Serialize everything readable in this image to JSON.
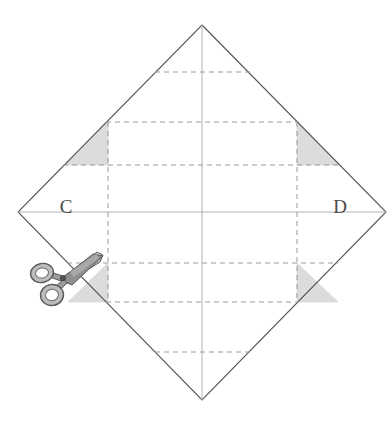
{
  "figure": {
    "canvas": {
      "width": 389,
      "height": 427,
      "background": "#ffffff"
    },
    "labels": [
      {
        "name": "vertex-label-c",
        "text": "C",
        "x": 66,
        "y": 213,
        "anchor": "middle"
      },
      {
        "name": "vertex-label-d",
        "text": "D",
        "x": 340,
        "y": 213,
        "anchor": "middle"
      }
    ],
    "colors": {
      "outline": "#555555",
      "fold_line": "#9a9aa0",
      "axis_line": "#b0b0b6",
      "shade_fill": "#dcdcdc",
      "shade_stroke": "#c8c8c8",
      "scissors_body": "#8c8c8c",
      "scissors_light": "#d0d0d0",
      "scissors_outline": "#5a5a5a",
      "label_text": "#4a4a4a"
    },
    "diamond": {
      "name": "paper-square-outline",
      "top": {
        "x": 202,
        "y": 25
      },
      "right": {
        "x": 386,
        "y": 212
      },
      "bottom": {
        "x": 202,
        "y": 400
      },
      "left": {
        "x": 18,
        "y": 212
      },
      "points": "202,25 386,212 202,400 18,212"
    },
    "axes": {
      "horizontal": {
        "name": "horizontal-center-axis",
        "x1": 18,
        "y1": 212,
        "x2": 386,
        "y2": 212
      },
      "vertical": {
        "name": "vertical-center-axis",
        "x1": 202,
        "y1": 25,
        "x2": 202,
        "y2": 400
      }
    },
    "fold_lines_horizontal": [
      {
        "name": "fold-line-h1",
        "y": 72,
        "x1": 155,
        "x2": 250
      },
      {
        "name": "fold-line-h2",
        "y": 122,
        "x1": 106,
        "x2": 299
      },
      {
        "name": "fold-line-h3",
        "y": 165,
        "x1": 63,
        "x2": 341
      },
      {
        "name": "fold-line-h4",
        "y": 263,
        "x1": 67,
        "x2": 338
      },
      {
        "name": "fold-line-h5",
        "y": 302,
        "x1": 106,
        "x2": 299
      },
      {
        "name": "fold-line-h6",
        "y": 352,
        "x1": 155,
        "x2": 250
      }
    ],
    "fold_lines_vertical": [
      {
        "name": "fold-line-v1",
        "x": 108,
        "y1": 122,
        "y2": 302
      },
      {
        "name": "fold-line-v2",
        "x": 297,
        "y1": 122,
        "y2": 302
      }
    ],
    "shaded_triangles": [
      {
        "name": "shaded-corner-top-left",
        "points": "108,122 108,165 65,165"
      },
      {
        "name": "shaded-corner-top-right",
        "points": "297,122 297,165 340,165"
      },
      {
        "name": "shaded-corner-bottom-left",
        "points": "108,263 108,302 68,302"
      },
      {
        "name": "shaded-corner-bottom-right",
        "points": "297,263 297,302 338,302"
      }
    ],
    "scissors": {
      "name": "scissors-icon",
      "description": "scissors cutting the lower-left edge of the paper",
      "pivot": {
        "x": 63,
        "y": 277
      },
      "blade_tip": {
        "x": 102,
        "y": 256
      },
      "ring_upper": {
        "x": 42,
        "y": 273,
        "rx": 11,
        "ry": 9
      },
      "ring_lower": {
        "x": 52,
        "y": 294,
        "rx": 11,
        "ry": 10
      }
    }
  }
}
